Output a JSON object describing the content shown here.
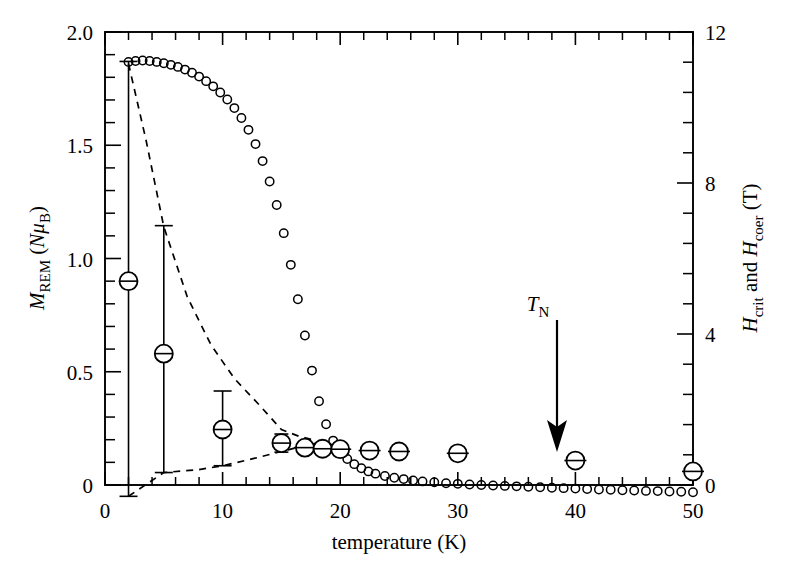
{
  "chart_data": {
    "type": "scatter",
    "title": "",
    "xlabel": "temperature (K)",
    "ylabel_left": "M_REM (Nμ_B)",
    "ylabel_right": "H_crit and H_coer (T)",
    "xlim": [
      0,
      50
    ],
    "ylim_left": [
      0,
      2.0
    ],
    "ylim_right": [
      0,
      12
    ],
    "grid": false,
    "legend": false,
    "xticks": [
      0,
      10,
      20,
      30,
      40,
      50
    ],
    "xtick_labels": [
      "0",
      "10",
      "20",
      "30",
      "40",
      "50"
    ],
    "xminor_step": 2,
    "yticks_left": [
      0,
      0.5,
      1.0,
      1.5,
      2.0
    ],
    "ytick_labels_left": [
      "0",
      "0.5",
      "1.0",
      "1.5",
      "2.0"
    ],
    "yminor_step_left": 0.1,
    "yticks_right": [
      0,
      4,
      8,
      12
    ],
    "ytick_labels_right": [
      "0",
      "4",
      "8",
      "12"
    ],
    "yminor_step_right": 0.8,
    "annotations": [
      {
        "text": "T_N",
        "x": 38,
        "y_left": 1.45,
        "arrow_to_y_left": 0.06,
        "note": "Neel temperature arrow"
      }
    ],
    "series": [
      {
        "name": "M_REM small open circles",
        "marker": "open-circle",
        "axis": "left",
        "points": [
          [
            2.0,
            1.868
          ],
          [
            2.6,
            1.872
          ],
          [
            3.2,
            1.874
          ],
          [
            3.8,
            1.872
          ],
          [
            4.4,
            1.868
          ],
          [
            5.0,
            1.862
          ],
          [
            5.6,
            1.855
          ],
          [
            6.2,
            1.846
          ],
          [
            6.8,
            1.834
          ],
          [
            7.4,
            1.82
          ],
          [
            8.0,
            1.803
          ],
          [
            8.6,
            1.783
          ],
          [
            9.2,
            1.76
          ],
          [
            9.8,
            1.733
          ],
          [
            10.4,
            1.702
          ],
          [
            11.0,
            1.664
          ],
          [
            11.6,
            1.62
          ],
          [
            12.2,
            1.568
          ],
          [
            12.8,
            1.505
          ],
          [
            13.4,
            1.43
          ],
          [
            14.0,
            1.34
          ],
          [
            14.6,
            1.236
          ],
          [
            15.2,
            1.112
          ],
          [
            15.8,
            0.972
          ],
          [
            16.4,
            0.82
          ],
          [
            17.0,
            0.66
          ],
          [
            17.6,
            0.505
          ],
          [
            18.2,
            0.37
          ],
          [
            18.8,
            0.268
          ],
          [
            19.4,
            0.196
          ],
          [
            20.0,
            0.148
          ],
          [
            20.6,
            0.115
          ],
          [
            21.2,
            0.092
          ],
          [
            21.8,
            0.074
          ],
          [
            22.4,
            0.06
          ],
          [
            23.0,
            0.05
          ],
          [
            23.8,
            0.04
          ],
          [
            24.6,
            0.032
          ],
          [
            25.4,
            0.026
          ],
          [
            26.2,
            0.02
          ],
          [
            27.0,
            0.016
          ],
          [
            28.0,
            0.012
          ],
          [
            29.0,
            0.008
          ],
          [
            30.0,
            0.005
          ],
          [
            31.0,
            0.002
          ],
          [
            32.0,
            0.0
          ],
          [
            33.0,
            -0.002
          ],
          [
            34.0,
            -0.004
          ],
          [
            35.0,
            -0.006
          ],
          [
            36.0,
            -0.008
          ],
          [
            37.0,
            -0.01
          ],
          [
            38.0,
            -0.012
          ],
          [
            39.0,
            -0.014
          ],
          [
            40.0,
            -0.016
          ],
          [
            41.0,
            -0.018
          ],
          [
            42.0,
            -0.02
          ],
          [
            43.0,
            -0.021
          ],
          [
            44.0,
            -0.023
          ],
          [
            45.0,
            -0.024
          ],
          [
            46.0,
            -0.026
          ],
          [
            47.0,
            -0.027
          ],
          [
            48.0,
            -0.029
          ],
          [
            49.0,
            -0.03
          ],
          [
            50.0,
            -0.032
          ]
        ]
      },
      {
        "name": "H_crit large circles with vertical error bars",
        "marker": "big-open-circle",
        "axis": "right",
        "points_with_err": [
          {
            "x": 2,
            "y_left": 0.9,
            "lo_left": -0.05,
            "hi_left": 1.87,
            "bar": "vertical"
          },
          {
            "x": 5,
            "y_left": 0.58,
            "lo_left": 0.055,
            "hi_left": 1.145,
            "bar": "vertical"
          },
          {
            "x": 10,
            "y_left": 0.245,
            "lo_left": 0.085,
            "hi_left": 0.415,
            "bar": "vertical"
          },
          {
            "x": 15,
            "y_left": 0.185,
            "lo_left": 0.145,
            "hi_left": 0.225,
            "bar": "vertical-small"
          },
          {
            "x": 17,
            "y_left": 0.165,
            "bar": "horizontal"
          },
          {
            "x": 18.5,
            "y_left": 0.16,
            "bar": "horizontal"
          },
          {
            "x": 20,
            "y_left": 0.158,
            "bar": "horizontal"
          },
          {
            "x": 22.5,
            "y_left": 0.152,
            "bar": "horizontal"
          },
          {
            "x": 25,
            "y_left": 0.148,
            "bar": "horizontal"
          },
          {
            "x": 30,
            "y_left": 0.14,
            "bar": "horizontal"
          },
          {
            "x": 40,
            "y_left": 0.108,
            "bar": "horizontal"
          },
          {
            "x": 50,
            "y_left": 0.06,
            "bar": "horizontal"
          }
        ]
      }
    ],
    "dashed_guides": [
      {
        "name": "upper dashed guide",
        "path_left_axis": [
          [
            2,
            1.86
          ],
          [
            3.5,
            1.52
          ],
          [
            5,
            1.14
          ],
          [
            7,
            0.83
          ],
          [
            9,
            0.62
          ],
          [
            11,
            0.47
          ],
          [
            13,
            0.36
          ],
          [
            15,
            0.245
          ],
          [
            16.5,
            0.215
          ],
          [
            18,
            0.195
          ]
        ]
      },
      {
        "name": "lower dashed guide",
        "path_left_axis": [
          [
            2,
            -0.05
          ],
          [
            5,
            0.055
          ],
          [
            8,
            0.068
          ],
          [
            10,
            0.085
          ],
          [
            12.5,
            0.115
          ],
          [
            15,
            0.148
          ],
          [
            16.5,
            0.168
          ],
          [
            18,
            0.185
          ]
        ]
      }
    ]
  },
  "axes": {
    "x_title": "temperature (K)",
    "left_title_main": "M",
    "left_title_sub": "REM",
    "left_title_units_open": " (",
    "left_title_units_N": "N",
    "left_title_units_mu": "μ",
    "left_title_units_B": "B",
    "left_title_units_close": ")",
    "right_title_H1": "H",
    "right_title_sub1": "crit",
    "right_title_and": " and ",
    "right_title_H2": "H",
    "right_title_sub2": "coer",
    "right_title_units": " (T)"
  },
  "annotation": {
    "tn_label_main": "T",
    "tn_label_sub": "N"
  },
  "style": {
    "ink": "#000000",
    "background": "#ffffff"
  }
}
